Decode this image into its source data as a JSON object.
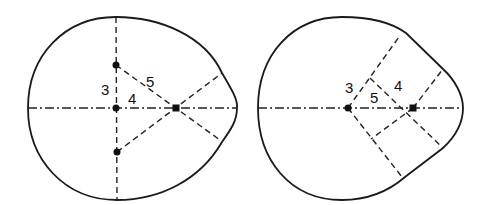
{
  "figures": [
    {
      "id": "left",
      "description": "Oval outline constructed from a 3-4-5 triangle with three centers on vertical axis and one on horizontal axis",
      "labels": {
        "a": "3",
        "b": "4",
        "c": "5"
      },
      "points": [
        {
          "name": "upper-center",
          "x": 116,
          "y": 65
        },
        {
          "name": "origin",
          "x": 116,
          "y": 108
        },
        {
          "name": "lower-center",
          "x": 117,
          "y": 152
        },
        {
          "name": "right-center",
          "x": 176,
          "y": 108
        }
      ]
    },
    {
      "id": "right",
      "description": "Egg/pear outline constructed from a 3-4-5 right triangle with two centers on horizontal axis",
      "labels": {
        "a": "3",
        "b": "4",
        "c": "5"
      },
      "points": [
        {
          "name": "main-center",
          "x": 348,
          "y": 108
        },
        {
          "name": "secondary-center",
          "x": 413,
          "y": 108
        }
      ]
    }
  ],
  "colors": {
    "line": "#1a1a1a",
    "background": "#ffffff"
  }
}
